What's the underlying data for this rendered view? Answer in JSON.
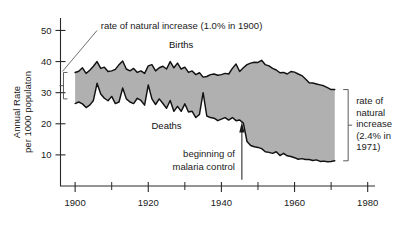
{
  "chart_data": {
    "type": "area",
    "title": "",
    "subtitle": "",
    "xlabel": "",
    "ylabel": "Annual Rate\nper 1000 populaton",
    "ylabel_line1": "Annual Rate",
    "ylabel_line2": "per 1000 populaton",
    "xlim": [
      1896,
      1982
    ],
    "ylim": [
      0,
      54
    ],
    "grid": false,
    "legend": "inline-labels",
    "y_ticks": [
      10,
      20,
      30,
      40,
      50
    ],
    "y_tick_labels": [
      "10",
      "20",
      "30",
      "40",
      "50"
    ],
    "x_ticks": [
      1900,
      1910,
      1920,
      1930,
      1940,
      1950,
      1960,
      1970,
      1980
    ],
    "x_tick_labels_major": [
      "1900",
      "1920",
      "1940",
      "1960",
      "1980"
    ],
    "x_major_ticks": [
      1900,
      1920,
      1940,
      1960,
      1980
    ],
    "x_minor_ticks": [
      1910,
      1930,
      1950,
      1970
    ],
    "fill_color": "#b0b0b0",
    "line_color": "#111111",
    "series": [
      {
        "name": "Births",
        "label": "Births",
        "x": [
          1900,
          1901,
          1902,
          1903,
          1904,
          1905,
          1906,
          1907,
          1908,
          1909,
          1910,
          1911,
          1912,
          1913,
          1914,
          1915,
          1916,
          1917,
          1918,
          1919,
          1920,
          1921,
          1922,
          1923,
          1924,
          1925,
          1926,
          1927,
          1928,
          1929,
          1930,
          1931,
          1932,
          1933,
          1934,
          1935,
          1936,
          1937,
          1938,
          1939,
          1940,
          1941,
          1942,
          1943,
          1944,
          1945,
          1946,
          1947,
          1948,
          1949,
          1950,
          1951,
          1952,
          1953,
          1954,
          1955,
          1956,
          1957,
          1958,
          1959,
          1960,
          1961,
          1962,
          1963,
          1964,
          1965,
          1966,
          1967,
          1968,
          1969,
          1970,
          1971
        ],
        "values": [
          36.5,
          36.9,
          38.0,
          36.2,
          37.2,
          38.5,
          40.0,
          37.8,
          38.2,
          36.8,
          37.0,
          37.5,
          39.0,
          40.2,
          37.6,
          37.0,
          37.8,
          36.5,
          37.0,
          36.2,
          38.6,
          39.0,
          37.0,
          38.0,
          38.5,
          37.6,
          40.0,
          38.0,
          39.5,
          37.6,
          38.2,
          36.5,
          37.0,
          35.8,
          36.4,
          35.0,
          35.2,
          35.8,
          36.0,
          35.6,
          35.8,
          36.2,
          36.0,
          37.8,
          39.2,
          36.8,
          38.0,
          39.0,
          39.5,
          39.8,
          39.7,
          40.4,
          39.0,
          38.6,
          37.8,
          37.3,
          36.4,
          36.5,
          36.0,
          36.8,
          36.6,
          36.0,
          35.5,
          34.4,
          33.2,
          33.1,
          32.8,
          32.5,
          32.2,
          31.6,
          31.0,
          31.0
        ]
      },
      {
        "name": "Deaths",
        "label": "Deaths",
        "x": [
          1900,
          1901,
          1902,
          1903,
          1904,
          1905,
          1906,
          1907,
          1908,
          1909,
          1910,
          1911,
          1912,
          1913,
          1914,
          1915,
          1916,
          1917,
          1918,
          1919,
          1920,
          1921,
          1922,
          1923,
          1924,
          1925,
          1926,
          1927,
          1928,
          1929,
          1930,
          1931,
          1932,
          1933,
          1934,
          1935,
          1936,
          1937,
          1938,
          1939,
          1940,
          1941,
          1942,
          1943,
          1944,
          1945,
          1946,
          1947,
          1948,
          1949,
          1950,
          1951,
          1952,
          1953,
          1954,
          1955,
          1956,
          1957,
          1958,
          1959,
          1960,
          1961,
          1962,
          1963,
          1964,
          1965,
          1966,
          1967,
          1968,
          1969,
          1970,
          1971
        ],
        "values": [
          26.5,
          27.0,
          26.4,
          25.2,
          26.0,
          27.5,
          33.0,
          29.6,
          28.2,
          27.4,
          28.8,
          26.5,
          27.0,
          31.5,
          28.0,
          27.0,
          26.5,
          28.2,
          27.5,
          26.0,
          32.5,
          28.0,
          26.2,
          28.0,
          26.5,
          25.0,
          27.5,
          24.0,
          25.6,
          24.0,
          26.4,
          23.8,
          24.0,
          22.0,
          23.0,
          30.0,
          22.5,
          22.0,
          21.8,
          21.0,
          21.5,
          22.0,
          21.2,
          22.0,
          21.0,
          21.2,
          20.2,
          14.3,
          13.0,
          12.6,
          12.4,
          12.0,
          11.0,
          10.8,
          10.5,
          11.0,
          9.8,
          10.5,
          9.7,
          9.5,
          9.1,
          8.6,
          8.8,
          8.5,
          8.5,
          8.2,
          8.4,
          7.9,
          8.0,
          7.8,
          7.9,
          8.1
        ]
      }
    ],
    "annotations": [
      {
        "id": "left-annotation",
        "text": "rate of natural increase (1.0% in 1900)",
        "type": "leader-label",
        "points_to_year": 1900
      },
      {
        "id": "right-annotation",
        "line1": "rate of",
        "line2": "natural",
        "line3": "increase",
        "line4": "(2.4% in",
        "line5": "1971)",
        "type": "bracket-label",
        "points_to_year": 1971
      },
      {
        "id": "malaria-annotation",
        "line1": "beginning of",
        "line2": "malaria control",
        "type": "arrow-label",
        "points_to_year": 1946
      }
    ]
  }
}
